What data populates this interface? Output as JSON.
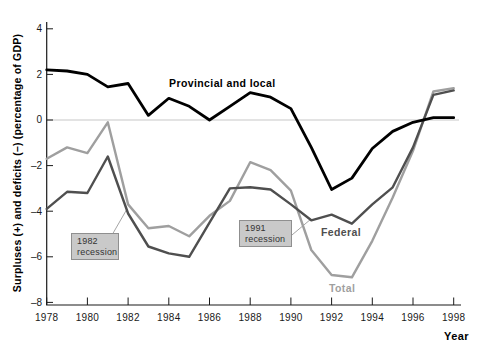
{
  "chart_data": {
    "type": "line",
    "title": "",
    "xlabel": "Year",
    "ylabel": "Surpluses (+) and deficits (–) (percentage of GDP)",
    "x": [
      1978,
      1979,
      1980,
      1981,
      1982,
      1983,
      1984,
      1985,
      1986,
      1987,
      1988,
      1989,
      1990,
      1991,
      1992,
      1993,
      1994,
      1995,
      1996,
      1997,
      1998
    ],
    "xlim": [
      1978,
      1998
    ],
    "ylim": [
      -8,
      4.3
    ],
    "x_tick_labels": [
      "1978",
      "1980",
      "1982",
      "1984",
      "1986",
      "1988",
      "1990",
      "1992",
      "1994",
      "1996",
      "1998"
    ],
    "x_tick_values": [
      1978,
      1980,
      1982,
      1984,
      1986,
      1988,
      1990,
      1992,
      1994,
      1996,
      1998
    ],
    "y_tick_values": [
      4,
      2,
      0,
      -2,
      -4,
      -6,
      -8
    ],
    "y_tick_labels": [
      "4",
      "2",
      "0",
      "–2",
      "–4",
      "–6",
      "–8"
    ],
    "grid": "horizontal zero-line only",
    "legend_position": "inline-labels-on-lines",
    "series": [
      {
        "name": "Provincial and local",
        "color": "#000000",
        "width": 2.8,
        "values": [
          2.2,
          2.15,
          2.0,
          1.45,
          1.6,
          0.2,
          0.95,
          0.6,
          0.0,
          0.6,
          1.2,
          1.0,
          0.5,
          -1.2,
          -3.05,
          -2.55,
          -1.25,
          -0.5,
          -0.1,
          0.1,
          0.1
        ]
      },
      {
        "name": "Federal",
        "color": "#4f4f4f",
        "width": 2.4,
        "values": [
          -3.9,
          -3.15,
          -3.2,
          -1.6,
          -4.1,
          -5.55,
          -5.85,
          -6.0,
          -4.5,
          -3.0,
          -2.95,
          -3.05,
          -3.7,
          -4.4,
          -4.15,
          -4.55,
          -3.7,
          -2.95,
          -1.2,
          1.1,
          1.3
        ]
      },
      {
        "name": "Total",
        "color": "#9f9f9f",
        "width": 2.4,
        "values": [
          -1.7,
          -1.2,
          -1.45,
          -0.1,
          -3.7,
          -4.75,
          -4.65,
          -5.1,
          -4.2,
          -3.55,
          -1.85,
          -2.2,
          -3.1,
          -5.7,
          -6.8,
          -6.9,
          -5.3,
          -3.4,
          -1.35,
          1.25,
          1.4
        ]
      }
    ],
    "annotations": [
      {
        "id": "recession-1982",
        "line1": "1982",
        "line2": "recession",
        "points_to": "steep 1982 drop of federal and total balances"
      },
      {
        "id": "recession-1991",
        "line1": "1991",
        "line2": "recession",
        "points_to": "1991 low of federal balance"
      }
    ]
  },
  "labels": {
    "provincial": "Provincial and local",
    "federal": "Federal",
    "total": "Total",
    "xlabel": "Year",
    "ylabel": "Surpluses (+) and deficits (–) (percentage of GDP)",
    "rec82_line1": "1982",
    "rec82_line2": "recession",
    "rec91_line1": "1991",
    "rec91_line2": "recession"
  },
  "colors": {
    "provincial": "#000000",
    "federal": "#4f4f4f",
    "total": "#9f9f9f",
    "zero_line": "#c8c8c8",
    "axis": "#1a1a1a",
    "tick_text": "#1a1a1a",
    "leader_line": "#9a9a9a",
    "box_fill": "#c9c9c9",
    "box_border": "#8f8f8f",
    "box_text": "#333333"
  }
}
